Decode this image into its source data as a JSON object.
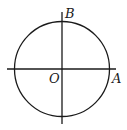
{
  "diagram": {
    "type": "unit-circle-axes",
    "colors": {
      "stroke": "#1a1a1a",
      "background": "#ffffff"
    },
    "circle": {
      "cx": 62,
      "cy": 69,
      "r": 47.5
    },
    "x_axis": {
      "x1": 7,
      "y": 69,
      "x2": 116
    },
    "y_axis": {
      "x": 62,
      "y1": 12,
      "y2": 124
    },
    "labels": {
      "origin": "O",
      "point_a": "A",
      "point_b": "B"
    }
  }
}
